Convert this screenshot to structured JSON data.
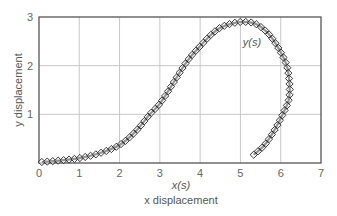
{
  "chart_data": {
    "type": "line",
    "title": "",
    "xlabel": "x displacement",
    "ylabel": "y displacement",
    "xlim": [
      0,
      7
    ],
    "ylim": [
      0,
      3
    ],
    "xticks": [
      "0",
      "1",
      "2",
      "3",
      "4",
      "5",
      "6",
      "7"
    ],
    "yticks": [
      "1",
      "2",
      "3"
    ],
    "grid": true,
    "legend": null,
    "annotations": [
      {
        "text": "y(s)",
        "x": 5.35,
        "y": 2.5
      },
      {
        "text": "x(s)",
        "x": 3.5,
        "y": -0.45,
        "note": "label below x-axis"
      }
    ],
    "series": [
      {
        "name": "parametric curve (x(s), y(s))",
        "style": "solid line with diamond markers",
        "x": [
          0.07,
          0.5,
          1.0,
          1.5,
          2.0,
          2.4,
          2.75,
          3.0,
          3.3,
          3.6,
          3.8,
          4.0,
          4.25,
          4.5,
          4.8,
          5.1,
          5.4,
          5.7,
          5.95,
          6.15,
          6.22,
          6.2,
          6.05,
          5.85,
          5.6,
          5.33
        ],
        "y": [
          0.02,
          0.05,
          0.1,
          0.2,
          0.37,
          0.65,
          1.0,
          1.22,
          1.6,
          2.0,
          2.22,
          2.4,
          2.62,
          2.78,
          2.87,
          2.9,
          2.85,
          2.65,
          2.35,
          2.0,
          1.6,
          1.3,
          1.0,
          0.68,
          0.37,
          0.17
        ]
      }
    ]
  },
  "labels": {
    "xlabel": "x displacement",
    "ylabel": "y displacement",
    "xcurve": "x(s)",
    "ycurve": "y(s)"
  }
}
